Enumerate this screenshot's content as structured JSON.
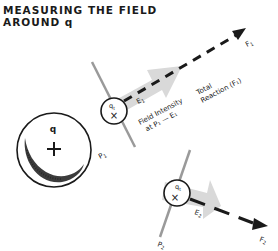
{
  "title": {
    "line1": "MEASURING THE FIELD",
    "line2": "AROUND q"
  },
  "source_charge": {
    "label": "q",
    "sign": "+"
  },
  "point1": {
    "test_charge_label": "q",
    "test_charge_subscript": "t",
    "sign": "×",
    "point_label": "P",
    "point_subscript": "1",
    "field_label": "E",
    "field_subscript": "1",
    "force_label": "F",
    "force_subscript": "1",
    "field_intensity_line1": "Field Intensity",
    "field_intensity_line2": "at P₁ — E₁",
    "total_reaction_line1": "Total",
    "total_reaction_line2": "Reaction (F₁)"
  },
  "point2": {
    "test_charge_label": "q",
    "test_charge_subscript": "t",
    "sign": "×",
    "point_label": "P",
    "point_subscript": "2",
    "field_label": "E",
    "field_subscript": "2",
    "force_label": "F",
    "force_subscript": "2"
  },
  "colors": {
    "ink": "#1a1a1a",
    "field_arrow": "#d9d9d9",
    "pole_line": "#9a9a9a"
  }
}
